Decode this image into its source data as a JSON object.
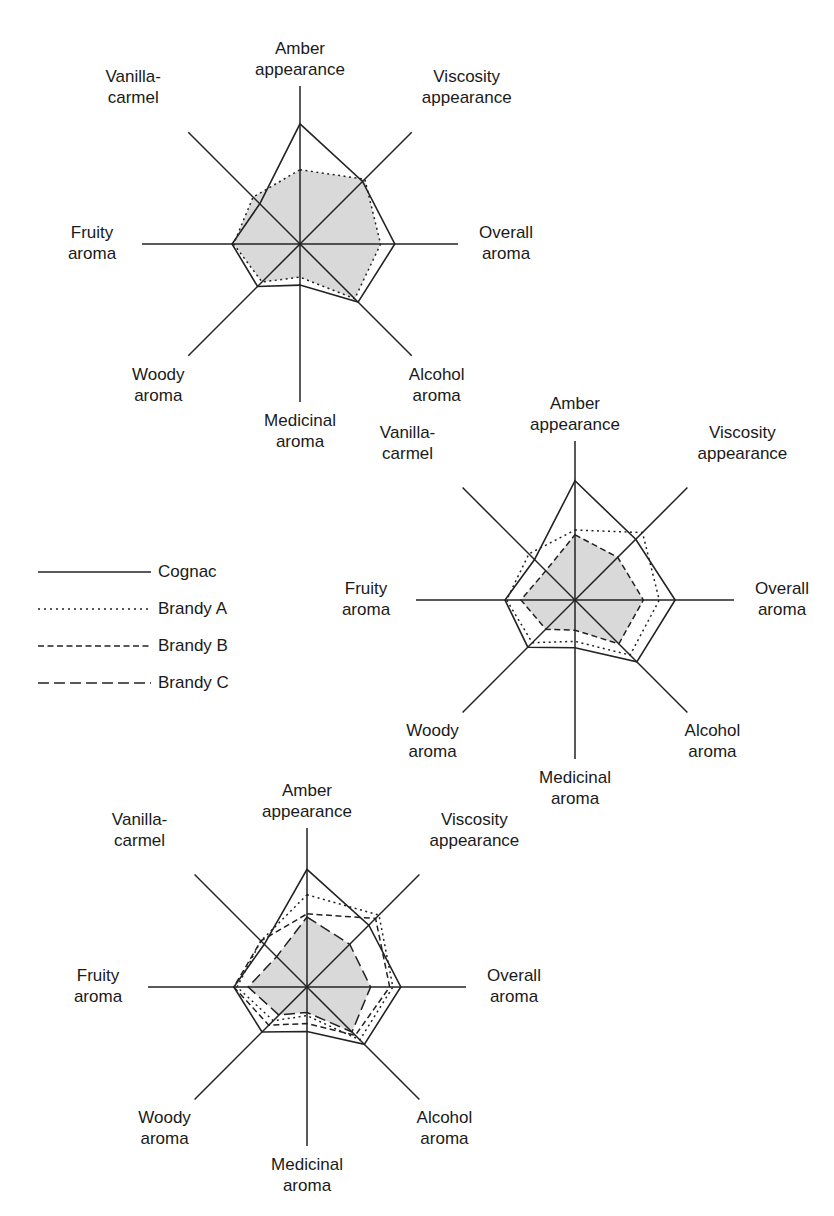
{
  "figure": {
    "axes": [
      "Amber appearance",
      "Viscosity appearance",
      "Overall aroma",
      "Alcohol aroma",
      "Medicinal aroma",
      "Woody aroma",
      "Fruity aroma",
      "Vanilla-carmel"
    ],
    "axis_label_lines": [
      [
        "Amber",
        "appearance"
      ],
      [
        "Viscosity",
        "appearance"
      ],
      [
        "Overall",
        "aroma"
      ],
      [
        "Alcohol",
        "aroma"
      ],
      [
        "Medicinal",
        "aroma"
      ],
      [
        "Woody",
        "aroma"
      ],
      [
        "Fruity",
        "aroma"
      ],
      [
        "Vanilla-",
        "carmel"
      ]
    ],
    "colors": {
      "line": "#222222",
      "fill": "#d9d9d9",
      "background": "#ffffff"
    }
  },
  "legend": {
    "items": [
      {
        "label": "Cognac",
        "style": "solid"
      },
      {
        "label": "Brandy A",
        "style": "dotted"
      },
      {
        "label": "Brandy B",
        "style": "dashed-short"
      },
      {
        "label": "Brandy C",
        "style": "dashed-long"
      }
    ]
  },
  "chart_data": [
    {
      "type": "radar",
      "title": "",
      "position": "top-left",
      "categories": [
        "Amber appearance",
        "Viscosity appearance",
        "Overall aroma",
        "Alcohol aroma",
        "Medicinal aroma",
        "Woody aroma",
        "Fruity aroma",
        "Vanilla-carmel"
      ],
      "range": [
        0,
        1
      ],
      "grid": false,
      "shaded_series": "Brandy A",
      "series": [
        {
          "name": "Cognac",
          "values": [
            0.76,
            0.56,
            0.6,
            0.52,
            0.26,
            0.38,
            0.43,
            0.36
          ]
        },
        {
          "name": "Brandy A",
          "values": [
            0.47,
            0.58,
            0.51,
            0.49,
            0.21,
            0.34,
            0.42,
            0.42
          ]
        }
      ]
    },
    {
      "type": "radar",
      "title": "",
      "position": "middle-right",
      "categories": [
        "Amber appearance",
        "Viscosity appearance",
        "Overall aroma",
        "Alcohol aroma",
        "Medicinal aroma",
        "Woody aroma",
        "Fruity aroma",
        "Vanilla-carmel"
      ],
      "range": [
        0,
        1
      ],
      "grid": false,
      "shaded_series": "Brandy B",
      "series": [
        {
          "name": "Cognac",
          "values": [
            0.75,
            0.54,
            0.63,
            0.55,
            0.3,
            0.42,
            0.44,
            0.36
          ]
        },
        {
          "name": "Brandy A",
          "values": [
            0.44,
            0.6,
            0.53,
            0.49,
            0.26,
            0.38,
            0.43,
            0.41
          ]
        },
        {
          "name": "Brandy B",
          "values": [
            0.41,
            0.38,
            0.43,
            0.39,
            0.19,
            0.26,
            0.34,
            0.26
          ]
        }
      ]
    },
    {
      "type": "radar",
      "title": "",
      "position": "bottom-left",
      "categories": [
        "Amber appearance",
        "Viscosity appearance",
        "Overall aroma",
        "Alcohol aroma",
        "Medicinal aroma",
        "Woody aroma",
        "Fruity aroma",
        "Vanilla-carmel"
      ],
      "range": [
        0,
        1
      ],
      "grid": false,
      "shaded_series": "Brandy C",
      "series": [
        {
          "name": "Cognac",
          "values": [
            0.74,
            0.55,
            0.59,
            0.51,
            0.28,
            0.4,
            0.46,
            0.38
          ]
        },
        {
          "name": "Brandy A",
          "values": [
            0.58,
            0.64,
            0.54,
            0.47,
            0.18,
            0.3,
            0.44,
            0.41
          ]
        },
        {
          "name": "Brandy B",
          "values": [
            0.46,
            0.61,
            0.52,
            0.43,
            0.23,
            0.34,
            0.46,
            0.41
          ]
        },
        {
          "name": "Brandy C",
          "values": [
            0.44,
            0.38,
            0.4,
            0.4,
            0.16,
            0.25,
            0.37,
            0.27
          ]
        }
      ]
    }
  ]
}
